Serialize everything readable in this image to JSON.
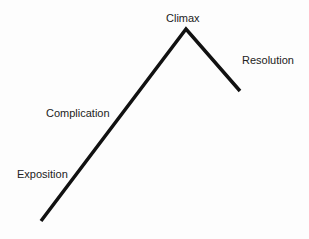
{
  "diagram": {
    "type": "plot-structure-arc",
    "labels": {
      "climax": "Climax",
      "resolution": "Resolution",
      "complication": "Complication",
      "exposition": "Exposition"
    },
    "line_color": "#111111",
    "points": [
      [
        41,
        221
      ],
      [
        186,
        29
      ],
      [
        240,
        91
      ]
    ]
  }
}
